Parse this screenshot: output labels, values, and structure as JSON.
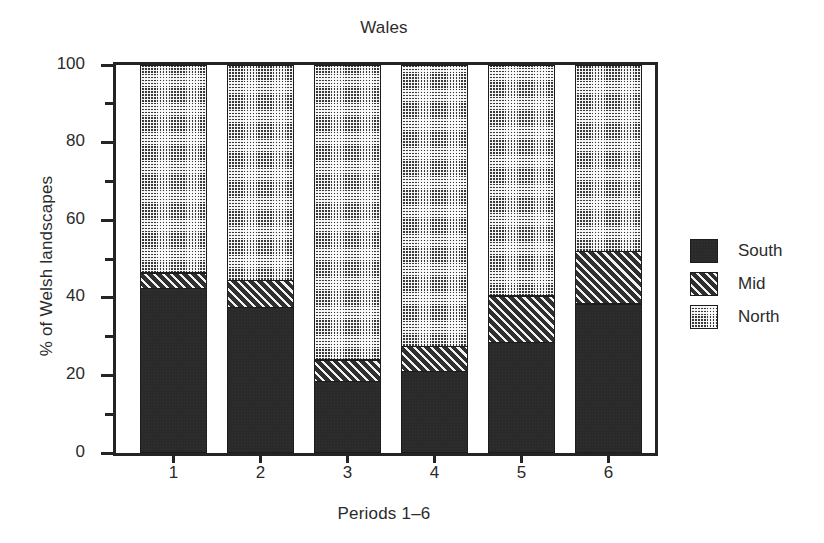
{
  "chart_data": {
    "type": "bar",
    "subtype": "stacked-100-percent",
    "title": "Wales",
    "xlabel": "Periods 1–6",
    "ylabel": "% of Welsh landscapes",
    "categories": [
      "1",
      "2",
      "3",
      "4",
      "5",
      "6"
    ],
    "xtick_labels": [
      "1",
      "2",
      "3",
      "4",
      "5",
      "6"
    ],
    "ytick_labels": [
      "0",
      "20",
      "40",
      "60",
      "80",
      "100"
    ],
    "ytick_values": [
      0,
      20,
      40,
      60,
      80,
      100
    ],
    "yminor_values": [
      10,
      30,
      50,
      70,
      90
    ],
    "ylim": [
      0,
      100
    ],
    "grid": false,
    "legend_position": "right",
    "series": [
      {
        "name": "South",
        "pattern": "solid-dark",
        "color": "#2a2a2a",
        "values": [
          42,
          37,
          18,
          20.5,
          28,
          38
        ]
      },
      {
        "name": "Mid",
        "pattern": "diagonal-hatch",
        "color": "#2f2f2f",
        "values": [
          4,
          7,
          5.5,
          6.5,
          12,
          13.5
        ]
      },
      {
        "name": "North",
        "pattern": "dotted-screen",
        "color": "#3a3a3a",
        "values": [
          54,
          56,
          76.5,
          73,
          60,
          48.5
        ]
      }
    ],
    "stack_tops": {
      "south": [
        42,
        37,
        18,
        20.5,
        28,
        38
      ],
      "mid": [
        46,
        44,
        23.5,
        27,
        40,
        51.5
      ],
      "north": [
        100,
        100,
        100,
        100,
        100,
        100
      ]
    }
  },
  "legend": {
    "items": [
      {
        "label": "South",
        "pattern": "solid-dark"
      },
      {
        "label": "Mid",
        "pattern": "diagonal-hatch"
      },
      {
        "label": "North",
        "pattern": "dotted-screen"
      }
    ]
  }
}
